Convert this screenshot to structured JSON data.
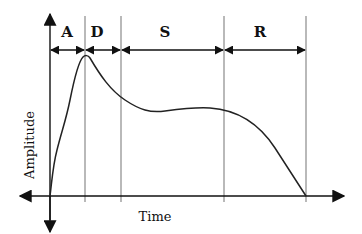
{
  "diagram": {
    "phases": [
      {
        "label": "A",
        "name": "Attack"
      },
      {
        "label": "D",
        "name": "Decay"
      },
      {
        "label": "S",
        "name": "Sustain"
      },
      {
        "label": "R",
        "name": "Release"
      }
    ],
    "x_axis_label": "Time",
    "y_axis_label": "Amplitude",
    "colors": {
      "curve": "#222222",
      "divider": "#8a8a8a",
      "axis": "#111111"
    }
  }
}
